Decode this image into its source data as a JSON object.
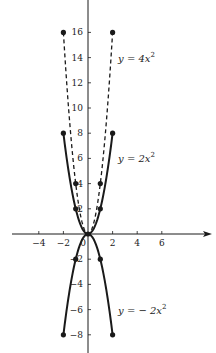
{
  "chart_data": {
    "type": "line",
    "title": "",
    "xlabel": "",
    "ylabel": "",
    "xlim": [
      -6.2,
      10
    ],
    "ylim": [
      -9.4,
      18.6
    ],
    "grid": false,
    "legend": "inline labels next to curves",
    "x_ticks": [
      -4,
      -2,
      0,
      2,
      4,
      6
    ],
    "x_tick_labels": [
      "−4",
      "−2",
      "0",
      "2",
      "4",
      "6"
    ],
    "y_ticks": [
      16,
      14,
      12,
      10,
      8,
      6,
      4,
      2,
      -2,
      -4,
      -6,
      -8
    ],
    "y_tick_labels": [
      "16",
      "14",
      "12",
      "10",
      "8",
      "6",
      "4",
      "2",
      "−2",
      "−4",
      "−6",
      "−8"
    ],
    "series": [
      {
        "name": "y = 4x²",
        "label_main": "y = 4x",
        "label_sup": "2",
        "style": "dashed",
        "coef": 4,
        "x": [
          -2,
          -1,
          0,
          1,
          2
        ],
        "y": [
          16,
          4,
          0,
          4,
          16
        ],
        "marked_points": [
          [
            -2,
            16
          ],
          [
            -1,
            4
          ],
          [
            1,
            4
          ],
          [
            2,
            16
          ]
        ],
        "label_at": [
          2.2,
          14
        ]
      },
      {
        "name": "y = 2x²",
        "label_main": "y = 2x",
        "label_sup": "2",
        "style": "solid",
        "coef": 2,
        "x": [
          -2,
          -1,
          0,
          1,
          2
        ],
        "y": [
          8,
          2,
          0,
          2,
          8
        ],
        "marked_points": [
          [
            -2,
            8
          ],
          [
            -1,
            2
          ],
          [
            1,
            2
          ],
          [
            2,
            8
          ]
        ],
        "label_at": [
          2.2,
          6
        ]
      },
      {
        "name": "y = −2x²",
        "label_main": "y = − 2x",
        "label_sup": "2",
        "style": "solid",
        "coef": -2,
        "x": [
          -2,
          -1,
          0,
          1,
          2
        ],
        "y": [
          -8,
          -2,
          0,
          -2,
          -8
        ],
        "marked_points": [
          [
            -2,
            -8
          ],
          [
            -1,
            -2
          ],
          [
            1,
            -2
          ],
          [
            2,
            -8
          ]
        ],
        "label_at": [
          2.2,
          -6
        ]
      }
    ],
    "colors": {
      "ink": "#1a1a1a",
      "background": "#ffffff"
    }
  }
}
